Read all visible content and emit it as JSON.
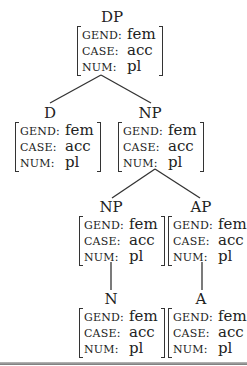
{
  "diagram": {
    "type": "syntax-tree-with-feature-structures",
    "nodes": [
      {
        "id": "dp",
        "label": "DP",
        "features": [
          {
            "name": "GEND:",
            "value": "fem"
          },
          {
            "name": "CASE:",
            "value": "acc"
          },
          {
            "name": "NUM:",
            "value": "pl"
          }
        ]
      },
      {
        "id": "d",
        "label": "D",
        "features": [
          {
            "name": "GEND:",
            "value": "fem"
          },
          {
            "name": "CASE:",
            "value": "acc"
          },
          {
            "name": "NUM:",
            "value": "pl"
          }
        ]
      },
      {
        "id": "np1",
        "label": "NP",
        "features": [
          {
            "name": "GEND:",
            "value": "fem"
          },
          {
            "name": "CASE:",
            "value": "acc"
          },
          {
            "name": "NUM:",
            "value": "pl"
          }
        ]
      },
      {
        "id": "np2",
        "label": "NP",
        "features": [
          {
            "name": "GEND:",
            "value": "fem"
          },
          {
            "name": "CASE:",
            "value": "acc"
          },
          {
            "name": "NUM:",
            "value": "pl"
          }
        ]
      },
      {
        "id": "ap",
        "label": "AP",
        "features": [
          {
            "name": "GEND:",
            "value": "fem"
          },
          {
            "name": "CASE:",
            "value": "acc"
          },
          {
            "name": "NUM:",
            "value": "pl"
          }
        ]
      },
      {
        "id": "n",
        "label": "N",
        "features": [
          {
            "name": "GEND:",
            "value": "fem"
          },
          {
            "name": "CASE:",
            "value": "acc"
          },
          {
            "name": "NUM:",
            "value": "pl"
          }
        ]
      },
      {
        "id": "a",
        "label": "A",
        "features": [
          {
            "name": "GEND:",
            "value": "fem"
          },
          {
            "name": "CASE:",
            "value": "acc"
          },
          {
            "name": "NUM:",
            "value": "pl"
          }
        ]
      }
    ],
    "edges": [
      {
        "from": "dp",
        "to": "d"
      },
      {
        "from": "dp",
        "to": "np1"
      },
      {
        "from": "np1",
        "to": "np2"
      },
      {
        "from": "np1",
        "to": "ap"
      },
      {
        "from": "np2",
        "to": "n"
      },
      {
        "from": "ap",
        "to": "a"
      }
    ]
  }
}
